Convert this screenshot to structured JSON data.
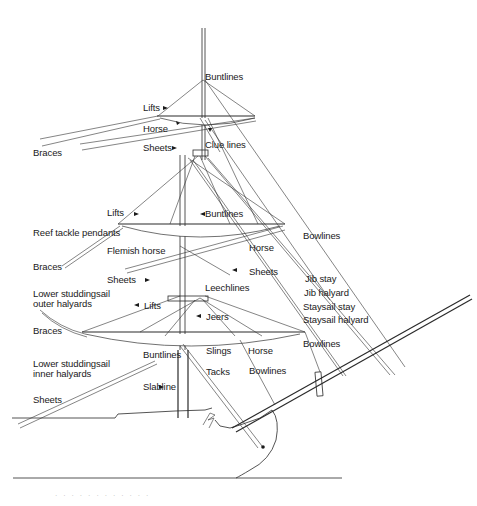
{
  "diagram": {
    "labels": [
      {
        "id": "buntlines-top",
        "text": "Buntlines",
        "x": 205,
        "y": 73
      },
      {
        "id": "lifts-top",
        "text": "Lifts",
        "x": 143,
        "y": 104
      },
      {
        "id": "horse-top",
        "text": "Horse",
        "x": 143,
        "y": 125
      },
      {
        "id": "braces-top",
        "text": "Braces",
        "x": 33,
        "y": 148
      },
      {
        "id": "sheets-top",
        "text": "Sheets",
        "x": 143,
        "y": 143
      },
      {
        "id": "clue-lines",
        "text": "Clue lines",
        "x": 205,
        "y": 141
      },
      {
        "id": "lifts-mid",
        "text": "Lifts",
        "x": 107,
        "y": 209
      },
      {
        "id": "buntlines-mid",
        "text": "Buntlines",
        "x": 205,
        "y": 210
      },
      {
        "id": "reef-tackle-pendants",
        "text": "Reef tackle pendants",
        "x": 33,
        "y": 229
      },
      {
        "id": "flemish-horse",
        "text": "Flemish horse",
        "x": 107,
        "y": 247
      },
      {
        "id": "horse-mid",
        "text": "Horse",
        "x": 249,
        "y": 243
      },
      {
        "id": "bowlines-upper",
        "text": "Bowlines",
        "x": 303,
        "y": 232
      },
      {
        "id": "braces-mid",
        "text": "Braces",
        "x": 33,
        "y": 262
      },
      {
        "id": "sheets-mid-right",
        "text": "Sheets",
        "x": 249,
        "y": 267
      },
      {
        "id": "sheets-mid-left",
        "text": "Sheets",
        "x": 107,
        "y": 275
      },
      {
        "id": "jib-stay",
        "text": "Jib stay",
        "x": 305,
        "y": 275
      },
      {
        "id": "lower-studdingsail-outer",
        "text": "Lower studdingsail\nouter halyards",
        "x": 33,
        "y": 289
      },
      {
        "id": "leechlines",
        "text": "Leechlines",
        "x": 205,
        "y": 283
      },
      {
        "id": "jib-halyard",
        "text": "Jib halyard",
        "x": 304,
        "y": 289
      },
      {
        "id": "lifts-lower",
        "text": "Lifts",
        "x": 144,
        "y": 301
      },
      {
        "id": "staysail-stay",
        "text": "Staysail stay",
        "x": 303,
        "y": 302
      },
      {
        "id": "jeers",
        "text": "Jeers",
        "x": 206,
        "y": 312
      },
      {
        "id": "staysail-halyard",
        "text": "Staysail halyard",
        "x": 303,
        "y": 315
      },
      {
        "id": "braces-lower",
        "text": "Braces",
        "x": 33,
        "y": 326
      },
      {
        "id": "slings",
        "text": "Slings",
        "x": 206,
        "y": 346
      },
      {
        "id": "horse-lower",
        "text": "Horse",
        "x": 248,
        "y": 346
      },
      {
        "id": "bowlines-mid",
        "text": "Bowlines",
        "x": 303,
        "y": 339
      },
      {
        "id": "lower-studdingsail-inner",
        "text": "Lower studdingsail\ninner halyards",
        "x": 33,
        "y": 359
      },
      {
        "id": "buntlines-lower",
        "text": "Buntlines",
        "x": 143,
        "y": 350
      },
      {
        "id": "tacks",
        "text": "Tacks",
        "x": 206,
        "y": 368
      },
      {
        "id": "bowlines-lower",
        "text": "Bowlines",
        "x": 249,
        "y": 367
      },
      {
        "id": "slabline",
        "text": "Slabline",
        "x": 143,
        "y": 382
      },
      {
        "id": "sheets-lower",
        "text": "Sheets",
        "x": 33,
        "y": 395
      }
    ],
    "caption": "· · · · · · · · · · · ·"
  }
}
